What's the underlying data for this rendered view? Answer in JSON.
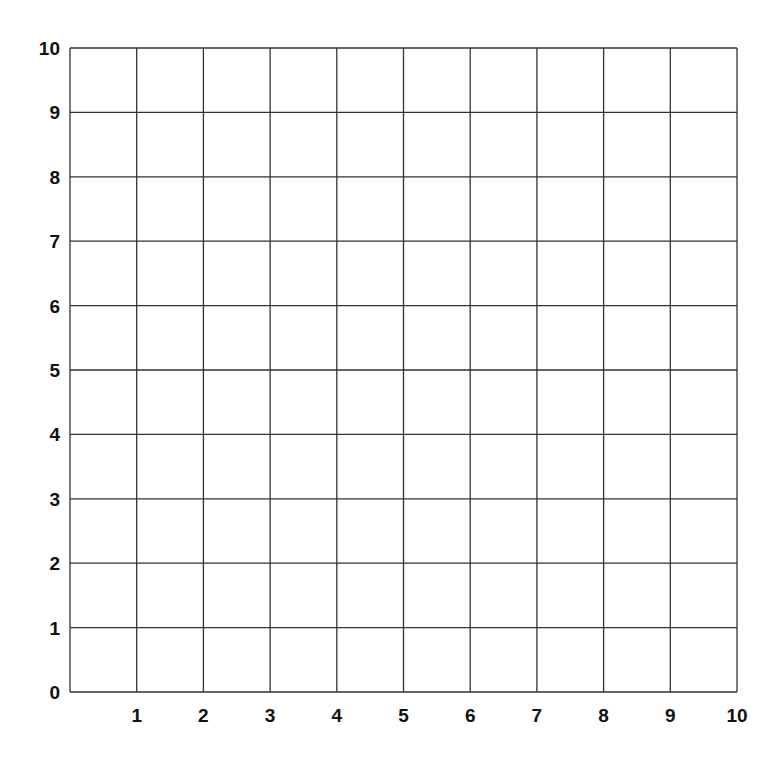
{
  "chart_data": {
    "type": "scatter",
    "title": "",
    "xlabel": "",
    "ylabel": "",
    "xlim": [
      0,
      10
    ],
    "ylim": [
      0,
      10
    ],
    "grid": true,
    "x_tick_labels": [
      "1",
      "2",
      "3",
      "4",
      "5",
      "6",
      "7",
      "8",
      "9",
      "10"
    ],
    "y_tick_labels": [
      "0",
      "1",
      "2",
      "3",
      "4",
      "5",
      "6",
      "7",
      "8",
      "9",
      "10"
    ],
    "series": [],
    "legend": null
  },
  "style": {
    "grid_color": "#333333",
    "label_color": "#111111",
    "background": "#ffffff"
  }
}
